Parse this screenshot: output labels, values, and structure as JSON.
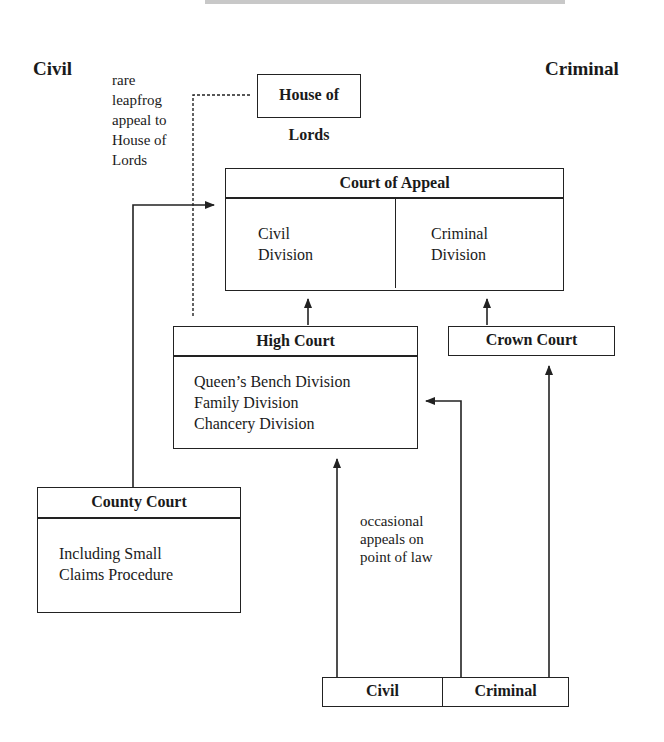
{
  "diagram": {
    "type": "court-hierarchy",
    "side_labels": {
      "left": "Civil",
      "right": "Criminal"
    },
    "annotations": {
      "leapfrog": [
        "rare",
        "leapfrog",
        "appeal to",
        "House of",
        "Lords"
      ],
      "point_of_law": [
        "occasional",
        "appeals on",
        "point of law"
      ]
    },
    "nodes": {
      "house_of_lords": {
        "title": "House of Lords"
      },
      "court_of_appeal": {
        "title": "Court of Appeal",
        "divisions": [
          {
            "line1": "Civil",
            "line2": "Division"
          },
          {
            "line1": "Criminal",
            "line2": "Division"
          }
        ]
      },
      "high_court": {
        "title": "High Court",
        "divisions": [
          "Queen’s Bench Division",
          "Family Division",
          "Chancery Division"
        ]
      },
      "crown_court": {
        "title": "Crown Court"
      },
      "county_court": {
        "title": "County Court",
        "body": [
          "Including Small",
          "Claims Procedure"
        ]
      },
      "magistrates": {
        "civil": "Civil",
        "criminal": "Criminal"
      }
    },
    "edges": [
      {
        "from": "county_court",
        "to": "court_of_appeal",
        "style": "solid"
      },
      {
        "from": "high_court",
        "to": "house_of_lords",
        "style": "dashed",
        "label": "rare leapfrog appeal to House of Lords"
      },
      {
        "from": "high_court",
        "to": "court_of_appeal.civil",
        "style": "solid"
      },
      {
        "from": "crown_court",
        "to": "court_of_appeal.criminal",
        "style": "solid"
      },
      {
        "from": "magistrates.civil",
        "to": "high_court",
        "style": "solid"
      },
      {
        "from": "magistrates.criminal",
        "to": "high_court",
        "style": "solid",
        "label": "occasional appeals on point of law"
      },
      {
        "from": "magistrates.criminal",
        "to": "crown_court",
        "style": "solid"
      }
    ]
  }
}
